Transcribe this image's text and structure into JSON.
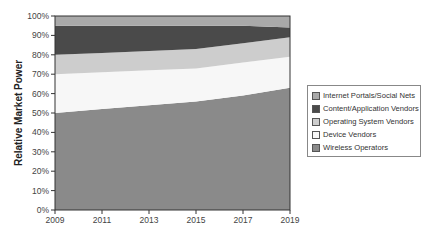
{
  "chart_data": {
    "type": "area",
    "stacked": true,
    "normalized_percent": true,
    "title": "",
    "xlabel": "",
    "ylabel": "Relative Market Power",
    "ylim": [
      0,
      100
    ],
    "xlim": [
      2009,
      2019
    ],
    "x": [
      2009,
      2011,
      2013,
      2015,
      2017,
      2019
    ],
    "x_tick_labels": [
      "2009",
      "2011",
      "2013",
      "2015",
      "2017",
      "2019"
    ],
    "y_tick_labels": [
      "0%",
      "10%",
      "20%",
      "30%",
      "40%",
      "50%",
      "60%",
      "70%",
      "80%",
      "90%",
      "100%"
    ],
    "grid": false,
    "legend_position": "right",
    "series": [
      {
        "name": "Wireless Operators",
        "color": "#8a8a8a",
        "values": [
          50,
          52,
          54,
          56,
          59,
          63
        ]
      },
      {
        "name": "Device Vendors",
        "color": "#f7f7f7",
        "values": [
          20,
          19,
          18,
          17,
          17,
          16
        ]
      },
      {
        "name": "Operating System Vendors",
        "color": "#cdcdcd",
        "values": [
          10,
          10,
          10,
          10,
          10,
          10
        ]
      },
      {
        "name": "Content/Application Vendors",
        "color": "#4a4a4a",
        "values": [
          15,
          14,
          13,
          12,
          9,
          5
        ]
      },
      {
        "name": "Internet Portals/Social Nets",
        "color": "#a9a9a9",
        "values": [
          5,
          5,
          5,
          5,
          5,
          6
        ]
      }
    ]
  },
  "legend": {
    "items": [
      {
        "label": "Internet Portals/Social Nets",
        "color": "#a9a9a9"
      },
      {
        "label": "Content/Application Vendors",
        "color": "#4a4a4a"
      },
      {
        "label": "Operating System Vendors",
        "color": "#cdcdcd"
      },
      {
        "label": "Device Vendors",
        "color": "#f7f7f7"
      },
      {
        "label": "Wireless Operators",
        "color": "#8a8a8a"
      }
    ]
  }
}
